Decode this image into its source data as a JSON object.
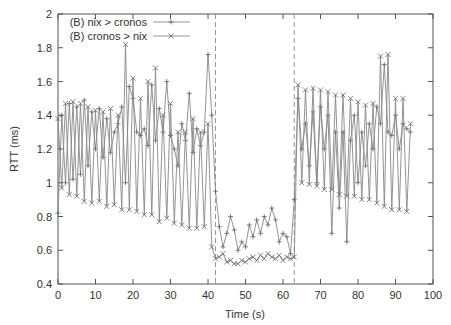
{
  "chart_data": {
    "type": "line",
    "title": "",
    "xlabel": "Time (s)",
    "ylabel": "RTT (ms)",
    "xlim": [
      0,
      100
    ],
    "ylim": [
      0.4,
      2
    ],
    "xticks": [
      0,
      10,
      20,
      30,
      40,
      50,
      60,
      70,
      80,
      90,
      100
    ],
    "yticks": [
      0.4,
      0.6,
      0.8,
      1,
      1.2,
      1.4,
      1.6,
      1.8,
      2
    ],
    "ytick_labels": [
      "0.4",
      "0.6",
      "0.8",
      "1",
      "1.2",
      "1.4",
      "1.6",
      "1.8",
      "2"
    ],
    "grid": false,
    "legend_position": "top-left",
    "vertical_markers": [
      42,
      63
    ],
    "series": [
      {
        "name": "(B) nix > cronos",
        "marker": "+",
        "x": [
          0,
          1,
          2,
          3,
          4,
          5,
          6,
          7,
          8,
          9,
          10,
          11,
          12,
          13,
          14,
          15,
          16,
          17,
          18,
          19,
          20,
          21,
          22,
          23,
          24,
          25,
          26,
          27,
          28,
          29,
          30,
          31,
          32,
          33,
          34,
          35,
          36,
          37,
          38,
          39,
          40,
          41,
          42,
          43,
          44,
          45,
          46,
          47,
          48,
          49,
          50,
          51,
          52,
          53,
          54,
          55,
          56,
          57,
          58,
          59,
          60,
          61,
          62,
          63,
          64,
          65,
          66,
          67,
          68,
          69,
          70,
          71,
          72,
          73,
          74,
          75,
          76,
          77,
          78,
          79,
          80,
          81,
          82,
          83,
          84,
          85,
          86,
          87,
          88,
          89,
          90,
          91,
          92,
          93,
          94
        ],
        "values": [
          0.82,
          1.4,
          1.0,
          1.47,
          1.02,
          1.45,
          1.05,
          1.49,
          1.1,
          1.42,
          1.2,
          1.44,
          1.15,
          1.38,
          1.18,
          1.3,
          1.35,
          1.45,
          1.0,
          1.57,
          1.5,
          1.3,
          1.28,
          1.32,
          1.22,
          1.58,
          1.25,
          1.44,
          1.3,
          1.6,
          1.28,
          1.2,
          1.1,
          1.35,
          1.25,
          1.53,
          1.18,
          1.32,
          1.22,
          1.3,
          1.76,
          1.4,
          0.95,
          0.74,
          0.62,
          0.7,
          0.8,
          0.72,
          0.6,
          0.65,
          0.62,
          0.75,
          0.68,
          0.78,
          0.7,
          0.8,
          0.75,
          0.85,
          0.78,
          0.65,
          0.7,
          0.68,
          0.58,
          0.9,
          1.5,
          1.2,
          1.35,
          1.1,
          1.42,
          1.0,
          1.45,
          1.2,
          1.4,
          0.7,
          1.3,
          0.85,
          1.3,
          0.65,
          1.25,
          1.4,
          1.0,
          1.3,
          1.1,
          1.35,
          1.2,
          1.45,
          1.35,
          1.7,
          1.3,
          1.28,
          1.4,
          1.2,
          1.35,
          1.32,
          1.3
        ]
      },
      {
        "name": "(B) cronos > nix",
        "marker": "x",
        "x": [
          0,
          1,
          2,
          3,
          4,
          5,
          6,
          7,
          8,
          9,
          10,
          11,
          12,
          13,
          14,
          15,
          16,
          17,
          18,
          19,
          20,
          21,
          22,
          23,
          24,
          25,
          26,
          27,
          28,
          29,
          30,
          31,
          32,
          33,
          34,
          35,
          36,
          37,
          38,
          39,
          40,
          41,
          42,
          43,
          44,
          45,
          46,
          47,
          48,
          49,
          50,
          51,
          52,
          53,
          54,
          55,
          56,
          57,
          58,
          59,
          60,
          61,
          62,
          63,
          64,
          65,
          66,
          67,
          68,
          69,
          70,
          71,
          72,
          73,
          74,
          75,
          76,
          77,
          78,
          79,
          80,
          81,
          82,
          83,
          84,
          85,
          86,
          87,
          88,
          89,
          90,
          91,
          92,
          93,
          94
        ],
        "values": [
          1.38,
          0.97,
          1.47,
          0.93,
          1.48,
          0.92,
          1.47,
          0.89,
          1.45,
          0.88,
          1.43,
          0.89,
          1.42,
          0.86,
          1.44,
          0.87,
          1.4,
          0.84,
          1.82,
          0.84,
          1.62,
          0.83,
          1.5,
          0.81,
          1.6,
          0.81,
          1.68,
          0.77,
          1.4,
          0.79,
          1.47,
          0.76,
          1.3,
          0.75,
          1.3,
          0.73,
          1.38,
          0.73,
          1.3,
          0.74,
          1.35,
          0.62,
          0.55,
          0.56,
          0.58,
          0.53,
          0.54,
          0.52,
          0.52,
          0.54,
          0.53,
          0.55,
          0.56,
          0.54,
          0.57,
          0.55,
          0.58,
          0.56,
          0.55,
          0.57,
          0.54,
          0.56,
          0.55,
          0.56,
          1.58,
          1.0,
          1.55,
          0.99,
          1.56,
          0.98,
          1.55,
          0.96,
          1.54,
          0.96,
          1.52,
          0.93,
          1.52,
          0.92,
          1.5,
          0.92,
          1.48,
          0.9,
          1.46,
          0.9,
          1.47,
          0.88,
          1.75,
          0.86,
          1.76,
          0.84,
          1.5,
          0.84,
          1.5,
          0.83,
          1.35
        ]
      }
    ]
  }
}
